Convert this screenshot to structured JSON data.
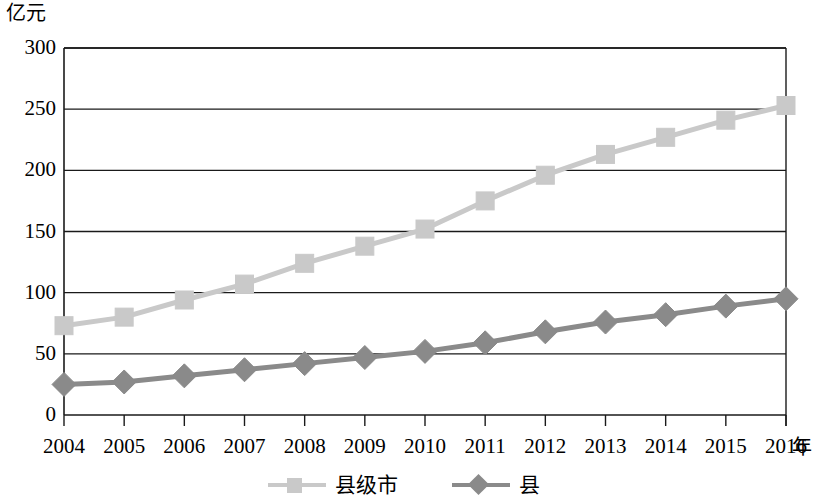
{
  "chart_data": {
    "type": "line",
    "title": "",
    "subtitle": "",
    "xlabel": "年",
    "ylabel": "亿元",
    "x": [
      2004,
      2005,
      2006,
      2007,
      2008,
      2009,
      2010,
      2011,
      2012,
      2013,
      2014,
      2015,
      2016
    ],
    "categories": [
      "2004",
      "2005",
      "2006",
      "2007",
      "2008",
      "2009",
      "2010",
      "2011",
      "2012",
      "2013",
      "2014",
      "2015",
      "2016"
    ],
    "series": [
      {
        "name": "县级市",
        "marker": "square",
        "color": "#c9c9c9",
        "values": [
          73,
          80,
          94,
          107,
          124,
          138,
          152,
          175,
          196,
          213,
          227,
          241,
          253
        ]
      },
      {
        "name": "县",
        "marker": "diamond",
        "color": "#8a8a8a",
        "values": [
          25,
          27,
          32,
          37,
          42,
          47,
          52,
          59,
          68,
          76,
          82,
          89,
          95
        ]
      }
    ],
    "ylim": [
      0,
      300
    ],
    "yticks": [
      0,
      50,
      100,
      150,
      200,
      250,
      300
    ],
    "ytick_labels": [
      "0",
      "50",
      "100",
      "150",
      "200",
      "250",
      "300"
    ],
    "xtick_labels": [
      "2004",
      "2005",
      "2006",
      "2007",
      "2008",
      "2009",
      "2010",
      "2011",
      "2012",
      "2013",
      "2014",
      "2015",
      "2016"
    ],
    "grid": "horizontal",
    "legend_position": "bottom",
    "axis_color": "#1a1a1a",
    "background": "#ffffff"
  },
  "axes": {
    "y_unit": "亿元",
    "x_unit": "年"
  },
  "legend": {
    "entries": [
      {
        "label": "县级市",
        "color": "#c9c9c9",
        "marker": "square"
      },
      {
        "label": "县",
        "color": "#8a8a8a",
        "marker": "diamond"
      }
    ]
  }
}
